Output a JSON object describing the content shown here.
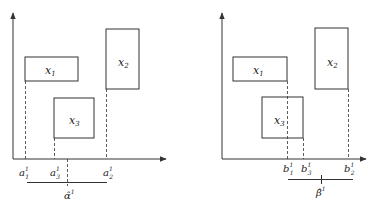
{
  "colors": {
    "stroke": "#333333",
    "background": "#ffffff"
  },
  "panels": [
    {
      "id": "left",
      "boxes": [
        {
          "name": "x1",
          "label": "x",
          "sub": "1"
        },
        {
          "name": "x2",
          "label": "x",
          "sub": "2"
        },
        {
          "name": "x3",
          "label": "x",
          "sub": "3"
        }
      ],
      "ticks": [
        {
          "label": "a",
          "sub": "1",
          "sup": "1"
        },
        {
          "label": "a",
          "sub": "3",
          "sup": "1"
        },
        {
          "label": "a",
          "sub": "2",
          "sup": "1"
        }
      ],
      "estimate": {
        "label": "α̂",
        "sup": "1"
      }
    },
    {
      "id": "right",
      "boxes": [
        {
          "name": "x1",
          "label": "x",
          "sub": "1"
        },
        {
          "name": "x2",
          "label": "x",
          "sub": "2"
        },
        {
          "name": "x3",
          "label": "x",
          "sub": "3"
        }
      ],
      "ticks": [
        {
          "label": "b",
          "sub": "1",
          "sup": "1"
        },
        {
          "label": "b",
          "sub": "3",
          "sup": "1"
        },
        {
          "label": "b",
          "sub": "2",
          "sup": "1"
        }
      ],
      "estimate": {
        "label": "β̂",
        "sup": "1"
      }
    }
  ]
}
